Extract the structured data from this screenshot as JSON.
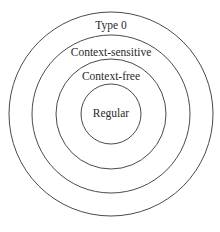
{
  "diagram": {
    "type": "nested-circles",
    "center": [
      111,
      114
    ],
    "stroke_color": "#4a4a4a",
    "text_color": "#2a2a2a",
    "levels": [
      {
        "label": "Type 0",
        "radius": 102,
        "label_y": 29
      },
      {
        "label": "Context-sensitive",
        "radius": 79,
        "label_y": 55
      },
      {
        "label": "Context-free",
        "radius": 55,
        "label_y": 79
      },
      {
        "label": "Regular",
        "radius": 30,
        "label_y": 117
      }
    ]
  }
}
